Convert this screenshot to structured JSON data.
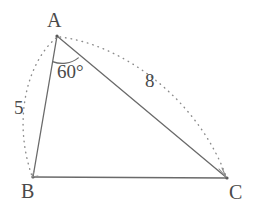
{
  "figure": {
    "type": "triangle-diagram",
    "background_color": "#ffffff",
    "stroke_color": "#6a6a6a",
    "text_color": "#4a4a4a",
    "vertices": [
      {
        "name": "A",
        "label": "A",
        "x": 57,
        "y": 36
      },
      {
        "name": "B",
        "label": "B",
        "x": 33,
        "y": 177
      },
      {
        "name": "C",
        "label": "C",
        "x": 227,
        "y": 178
      }
    ],
    "sides": [
      {
        "name": "AB",
        "from": "A",
        "to": "B",
        "style": "solid"
      },
      {
        "name": "BC",
        "from": "B",
        "to": "C",
        "style": "solid"
      },
      {
        "name": "AC",
        "from": "A",
        "to": "C",
        "style": "solid"
      }
    ],
    "measure_arcs": [
      {
        "name": "side-ab-measure",
        "side": "AB",
        "label": "5",
        "style": "dotted",
        "bulge": "outward-left"
      },
      {
        "name": "side-ac-measure",
        "side": "AC",
        "label": "8",
        "style": "dotted",
        "bulge": "outward-up"
      }
    ],
    "angles": [
      {
        "name": "angle-at-a",
        "vertex": "A",
        "label": "60°",
        "value": 60,
        "unit": "degrees",
        "arc_radius": 26
      }
    ]
  }
}
